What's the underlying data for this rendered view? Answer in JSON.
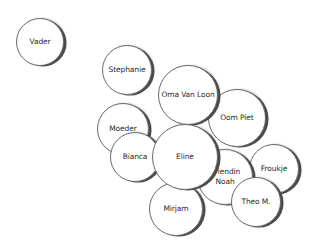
{
  "diagram": {
    "type": "relationship-bubble-map",
    "nodes": [
      {
        "id": "vader",
        "label": "Vader",
        "cx": 40,
        "cy": 42,
        "r": 24,
        "z": 1
      },
      {
        "id": "stephanie",
        "label": "Stephanie",
        "cx": 127,
        "cy": 70,
        "r": 25,
        "z": 1
      },
      {
        "id": "oom-piet",
        "label": "Oom Piet",
        "cx": 237,
        "cy": 118,
        "r": 29,
        "z": 1
      },
      {
        "id": "oma-van-loon",
        "label": "Oma Van Loon",
        "cx": 188,
        "cy": 95,
        "r": 30,
        "z": 2
      },
      {
        "id": "moeder",
        "label": "Moeder",
        "cx": 123,
        "cy": 129,
        "r": 26,
        "z": 1
      },
      {
        "id": "bianca",
        "label": "Bianca",
        "cx": 135,
        "cy": 157,
        "r": 25,
        "z": 2
      },
      {
        "id": "froukje",
        "label": "Froukje",
        "cx": 274,
        "cy": 169,
        "r": 25,
        "z": 1
      },
      {
        "id": "mirjam",
        "label": "Mirjam",
        "cx": 176,
        "cy": 209,
        "r": 27,
        "z": 2
      },
      {
        "id": "vriendin-noah",
        "label": "Vriendin\nNoah",
        "cx": 225,
        "cy": 177,
        "r": 28,
        "z": 3
      },
      {
        "id": "theo-m",
        "label": "Theo M.",
        "cx": 256,
        "cy": 202,
        "r": 25,
        "z": 4
      },
      {
        "id": "eline",
        "label": "Eline",
        "cx": 185,
        "cy": 157,
        "r": 33,
        "z": 5
      }
    ],
    "colors": {
      "background": "#ffffff",
      "fill": "#ffffff",
      "stroke": "#6a6a6a",
      "shadow": "#4a4a4a",
      "text": "#2a2a2a"
    }
  }
}
